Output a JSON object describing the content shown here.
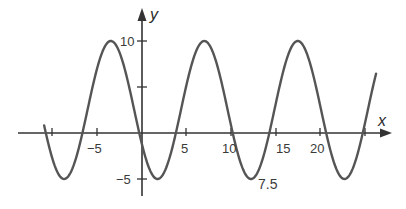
{
  "chart_data": {
    "type": "line",
    "title": "",
    "xlabel": "x",
    "ylabel": "y",
    "function": "y = 2.5 + 7.5*cos(2*pi*(x + 3.5)/10.5)",
    "amplitude": 7.5,
    "midline": 2.5,
    "period": 10.5,
    "xlim": [
      -11,
      26.3
    ],
    "ylim": [
      -5,
      10
    ],
    "x_ticks": [
      -10,
      -5,
      0,
      5,
      10,
      15,
      20,
      25
    ],
    "x_tick_labels": [
      "-5",
      "5",
      "10",
      "15",
      "20"
    ],
    "y_ticks": [
      -5,
      5,
      10
    ],
    "y_tick_labels": [
      "10",
      "-5"
    ],
    "annotations": [
      "7.5"
    ],
    "grid": false,
    "maxima_x": [
      -3.5,
      7,
      17.5
    ],
    "minima_x": [
      1.75,
      12.25,
      22.75
    ],
    "color": "#555555"
  },
  "labels": {
    "x_axis": "x",
    "y_axis": "y",
    "y10": "10",
    "yneg5": "−5",
    "xneg5": "−5",
    "x5": "5",
    "x10": "10",
    "x15": "15",
    "x20": "20",
    "amp": "7.5"
  }
}
